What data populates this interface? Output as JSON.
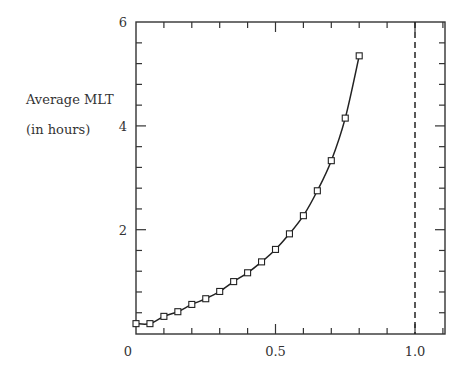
{
  "chart_data": {
    "type": "line",
    "title": "",
    "xlabel": "",
    "ylabel": "Average MLT",
    "ylabel_line2": "(in hours)",
    "xlim": [
      0,
      1.1
    ],
    "ylim": [
      0,
      6
    ],
    "x_ticks": [
      0,
      0.5,
      1.0
    ],
    "x_tick_labels": [
      "0",
      "0.5",
      "1.0"
    ],
    "x_minor_step": 0.1,
    "y_ticks": [
      2,
      4,
      6
    ],
    "y_tick_labels": [
      "2",
      "4",
      "6"
    ],
    "y_minor_step": 0.4,
    "grid": false,
    "legend": null,
    "marker": "square",
    "series": [
      {
        "name": "Average MLT",
        "x": [
          0.0,
          0.05,
          0.1,
          0.15,
          0.2,
          0.25,
          0.3,
          0.35,
          0.4,
          0.45,
          0.5,
          0.55,
          0.6,
          0.65,
          0.7,
          0.75,
          0.8
        ],
        "values": [
          0.19,
          0.19,
          0.33,
          0.42,
          0.56,
          0.67,
          0.81,
          1.0,
          1.17,
          1.38,
          1.62,
          1.92,
          2.27,
          2.75,
          3.33,
          4.15,
          5.35
        ]
      }
    ],
    "annotations": [
      {
        "type": "vline",
        "x": 1.0,
        "style": "dashed"
      }
    ]
  },
  "labels": {
    "ylabel_line1": "Average MLT",
    "ylabel_line2": "(in hours)"
  }
}
